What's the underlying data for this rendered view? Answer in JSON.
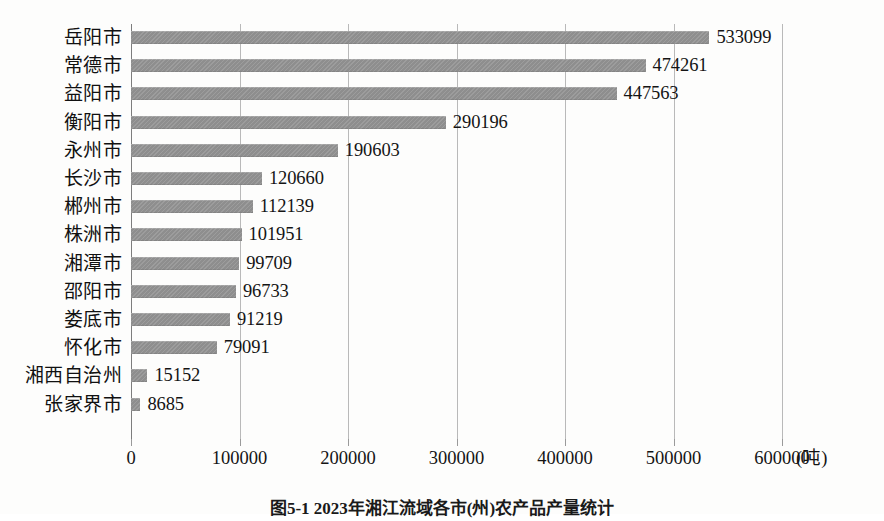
{
  "chart_data": {
    "type": "bar",
    "orientation": "horizontal",
    "title": "",
    "xlabel": "(吨)",
    "ylabel": "",
    "xlim": [
      0,
      600000
    ],
    "xticks": [
      "0",
      "100000",
      "200000",
      "300000",
      "400000",
      "500000",
      "600000"
    ],
    "xtick_values": [
      0,
      100000,
      200000,
      300000,
      400000,
      500000,
      600000
    ],
    "unit_label": "(吨)",
    "grid": true,
    "legend": "none",
    "bar_color": "#8e8e8e",
    "categories": [
      "岳阳市",
      "常德市",
      "益阳市",
      "衡阳市",
      "永州市",
      "长沙市",
      "郴州市",
      "株洲市",
      "湘潭市",
      "邵阳市",
      "娄底市",
      "怀化市",
      "湘西自治州",
      "张家界市"
    ],
    "values": [
      533099,
      474261,
      447563,
      290196,
      190603,
      120660,
      112139,
      101951,
      99709,
      96733,
      91219,
      79091,
      15152,
      8685
    ],
    "value_labels": [
      "533099",
      "474261",
      "447563",
      "290196",
      "190603",
      "120660",
      "112139",
      "101951",
      "99709",
      "96733",
      "91219",
      "79091",
      "15152",
      "8685"
    ]
  },
  "caption": {
    "text": "图5-1 2023年湘江流域各市(州)农产品产量统计"
  }
}
